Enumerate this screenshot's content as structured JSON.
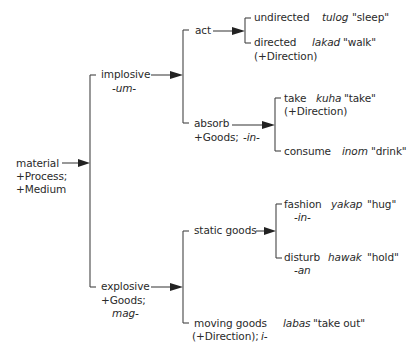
{
  "diagram": {
    "type": "system-network",
    "root": {
      "label": "material",
      "features": [
        "+Process;",
        "+Medium"
      ]
    },
    "nodes": {
      "implosive": {
        "label": "implosive",
        "marker": "-um-"
      },
      "explosive": {
        "label": "explosive",
        "features": "+Goods;",
        "marker": "mag-"
      },
      "act": {
        "label": "act"
      },
      "absorb": {
        "label": "absorb",
        "features": "+Goods;",
        "marker": "-in-"
      },
      "undirected": {
        "label": "undirected",
        "example": "tulog",
        "gloss": "\"sleep\""
      },
      "directed": {
        "label": "directed",
        "example": "lakad",
        "gloss": "\"walk\"",
        "features": "(+Direction)"
      },
      "take": {
        "label": "take",
        "example": "kuha",
        "gloss": "\"take\"",
        "features": "(+Direction)"
      },
      "consume": {
        "label": "consume",
        "example": "inom",
        "gloss": "\"drink\""
      },
      "static_goods": {
        "label": "static goods"
      },
      "fashion": {
        "label": "fashion",
        "marker": "-in-",
        "example": "yakap",
        "gloss": "\"hug\""
      },
      "disturb": {
        "label": "disturb",
        "marker": "-an",
        "example": "hawak",
        "gloss": "\"hold\""
      },
      "moving_goods": {
        "label": "moving goods",
        "features": "(+Direction);",
        "marker": "i-",
        "example": "labas",
        "gloss": "\"take out\""
      }
    },
    "edges": [
      [
        "material",
        "implosive"
      ],
      [
        "material",
        "explosive"
      ],
      [
        "implosive",
        "act"
      ],
      [
        "implosive",
        "absorb"
      ],
      [
        "act",
        "undirected"
      ],
      [
        "act",
        "directed"
      ],
      [
        "absorb",
        "take"
      ],
      [
        "absorb",
        "consume"
      ],
      [
        "explosive",
        "static_goods"
      ],
      [
        "explosive",
        "moving_goods"
      ],
      [
        "static_goods",
        "fashion"
      ],
      [
        "static_goods",
        "disturb"
      ]
    ]
  }
}
